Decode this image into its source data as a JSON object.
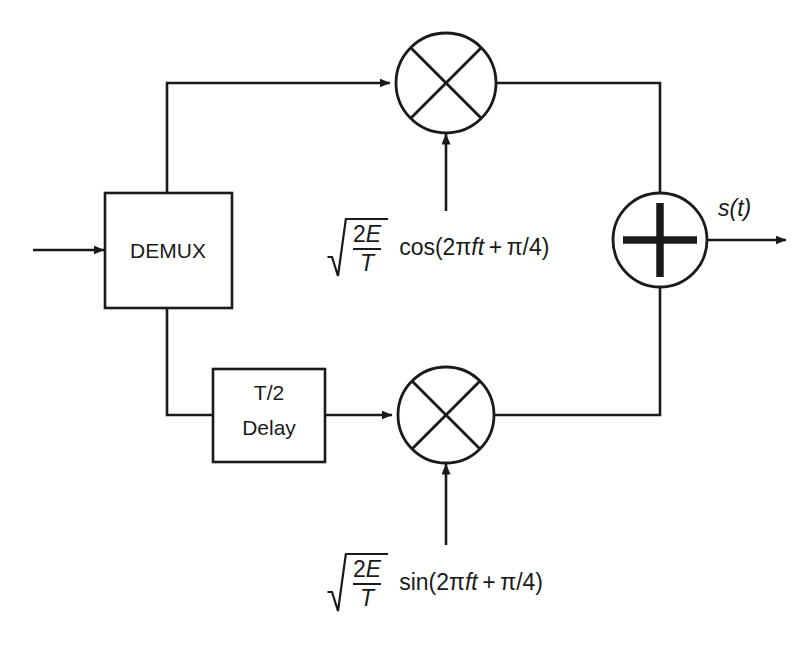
{
  "diagram": {
    "stroke_color": "#1a1a1a",
    "background_color": "#ffffff",
    "blocks": {
      "demux": {
        "label": "DEMUX"
      },
      "delay": {
        "label_line1": "T/2",
        "label_line2": "Delay"
      },
      "upper_multiplier": {
        "symbol": "cross-multiplier"
      },
      "lower_multiplier": {
        "symbol": "cross-multiplier"
      },
      "summer": {
        "symbol": "plus-adder"
      }
    },
    "labels": {
      "output": "s(t)"
    },
    "carriers": {
      "upper": {
        "radical": "sqrt",
        "numerator": "2E",
        "denominator": "T",
        "function": "cos",
        "argument": "(2πft + π/4)",
        "full_text": "√(2E/T) cos(2πft + π/4)"
      },
      "lower": {
        "radical": "sqrt",
        "numerator": "2E",
        "denominator": "T",
        "function": "sin",
        "argument": "(2πft + π/4)",
        "full_text": "√(2E/T) sin(2πft + π/4)"
      }
    }
  }
}
